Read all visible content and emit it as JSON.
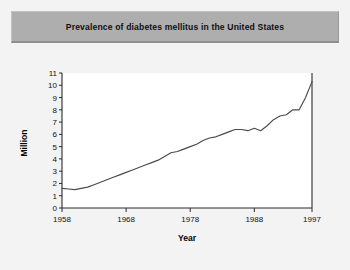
{
  "figure": {
    "title": "Prevalence of diabetes mellitus in the United States",
    "background_color": "#f3f3f3",
    "banner_color": "#aeaeae",
    "plot_background": "#ffffff",
    "line_color": "#4a4a4a"
  },
  "chart_data": {
    "type": "line",
    "title": "Prevalence of diabetes mellitus in the United States",
    "xlabel": "Year",
    "ylabel": "Million",
    "xlim": [
      1958,
      1997
    ],
    "ylim": [
      0,
      11
    ],
    "xticks": [
      1958,
      1968,
      1978,
      1988,
      1997
    ],
    "xtick_labels": [
      "1958",
      "1968",
      "1978",
      "1988",
      "1997"
    ],
    "yticks": [
      0,
      1,
      2,
      3,
      4,
      5,
      6,
      7,
      8,
      9,
      10,
      11
    ],
    "ytick_labels": [
      "0",
      "1",
      "2",
      "3",
      "4",
      "5",
      "6",
      "7",
      "8",
      "9",
      "10",
      "11"
    ],
    "grid": false,
    "legend": false,
    "series": [
      {
        "name": "Prevalence of diagnosed diabetes",
        "units": "Million",
        "x": [
          1958,
          1959,
          1960,
          1961,
          1962,
          1963,
          1964,
          1965,
          1966,
          1967,
          1968,
          1969,
          1970,
          1971,
          1972,
          1973,
          1974,
          1975,
          1976,
          1977,
          1978,
          1979,
          1980,
          1981,
          1982,
          1983,
          1984,
          1985,
          1986,
          1987,
          1988,
          1989,
          1990,
          1991,
          1992,
          1993,
          1994,
          1995,
          1996,
          1997
        ],
        "values": [
          1.6,
          1.55,
          1.5,
          1.6,
          1.7,
          1.9,
          2.1,
          2.3,
          2.5,
          2.7,
          2.9,
          3.1,
          3.3,
          3.5,
          3.7,
          3.9,
          4.2,
          4.5,
          4.6,
          4.8,
          5.0,
          5.2,
          5.5,
          5.7,
          5.8,
          6.0,
          6.2,
          6.4,
          6.4,
          6.3,
          6.5,
          6.3,
          6.7,
          7.2,
          7.5,
          7.6,
          8.0,
          8.0,
          9.0,
          10.3
        ]
      }
    ]
  }
}
